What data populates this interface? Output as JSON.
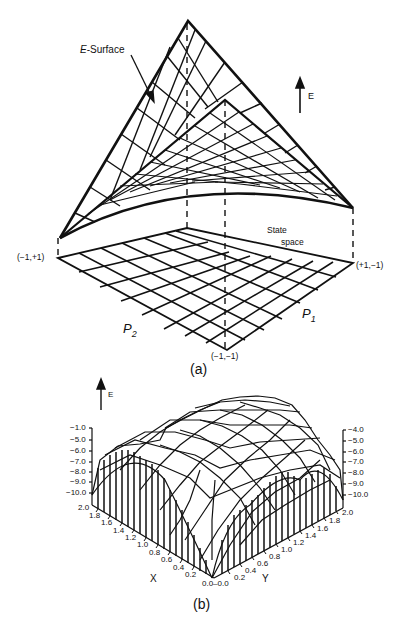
{
  "figure_a": {
    "caption": "(a)",
    "surface_label_italic": "E",
    "surface_label_rest": "-Surface",
    "energy_axis_label": "E",
    "state_space_line1": "State",
    "state_space_line2": "space",
    "corners": {
      "left": "(−1,+1)",
      "right": "(+1,−1)",
      "front": "(−1,−1)"
    },
    "axis_p2": {
      "letter": "P",
      "sub": "2"
    },
    "axis_p1": {
      "letter": "P",
      "sub": "1"
    }
  },
  "figure_b": {
    "caption": "(b)",
    "energy_axis_label": "E",
    "left_z_ticks": [
      "−1.0",
      "−5.0",
      "−6.0",
      "−7.0",
      "−8.0",
      "−9.0",
      "−10.0"
    ],
    "right_z_ticks": [
      "−4.0",
      "−5.0",
      "−6.0",
      "−7.0",
      "−8.0",
      "−9.0",
      "−10.0"
    ],
    "x_label": "X",
    "y_label": "Y",
    "x_ticks": [
      "2.0",
      "1.8",
      "1.6",
      "1.4",
      "1.2",
      "1.0",
      "0.8",
      "0.6",
      "0.4",
      "0.2"
    ],
    "y_ticks": [
      "0.2",
      "0.4",
      "0.6",
      "0.8",
      "1.0",
      "1.2",
      "1.4",
      "1.6",
      "1.8",
      "2.0"
    ],
    "origin_label": "0.0–0.0"
  }
}
